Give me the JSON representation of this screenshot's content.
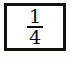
{
  "figure": {
    "type": "fraction",
    "kind": "boxed-fraction-figure",
    "numerator": "1",
    "denominator": "4",
    "value_text": "1/4",
    "bar_glyph": "",
    "colors": {
      "border": "#111111",
      "text": "#0d0d0d",
      "box_background": "#ffffff",
      "page_background": "#fdfdfc"
    }
  }
}
